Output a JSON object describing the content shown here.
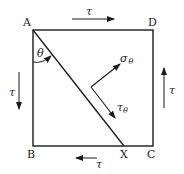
{
  "diagram": {
    "type": "stress element with inclined plane",
    "points": {
      "A": "A",
      "B": "B",
      "C": "C",
      "D": "D",
      "X": "X"
    },
    "angle_label": "θ",
    "shear_labels": {
      "top": "τ",
      "left": "τ",
      "right": "τ",
      "bottom": "τ"
    },
    "normal_stress": {
      "symbol": "σ",
      "subscript": "θ"
    },
    "shear_stress_on_plane": {
      "symbol": "τ",
      "subscript": "θ"
    },
    "colors": {
      "line": "#1a1a1a",
      "background": "#ffffff"
    }
  }
}
